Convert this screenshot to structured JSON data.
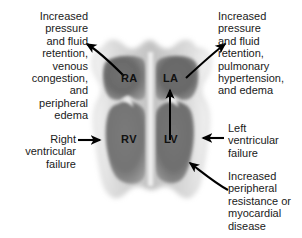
{
  "figure": {
    "type": "medical-diagram"
  },
  "chambers": [
    {
      "id": "ra",
      "label": "RA",
      "name": "right-atrium"
    },
    {
      "id": "la",
      "label": "LA",
      "name": "left-atrium"
    },
    {
      "id": "rv",
      "label": "RV",
      "name": "right-ventricle"
    },
    {
      "id": "lv",
      "label": "LV",
      "name": "left-ventricle"
    }
  ],
  "annotations": {
    "right_sided_congestion": "Increased\npressure\nand fluid\nretention,\nvenous\ncongestion,\nand\nperipheral\nedema",
    "left_sided_congestion": "Increased\npressure\nand fluid\nretention,\npulmonary\nhypertension,\nand edema",
    "right_ventricular_failure": "Right\nventricular\nfailure",
    "left_ventricular_failure": "Left\nventricular\nfailure",
    "afterload": "Increased\nperipheral\nresistance or\nmyocardial\ndisease"
  },
  "colors": {
    "background": "#ffffff",
    "text": "#1a1a1a",
    "arrow": "#000000",
    "myocardium_light": "#e8e8e8",
    "myocardium_mid": "#b4b4b4",
    "chamber_dark": "#585858",
    "chamber_mid": "#8c8c8c"
  }
}
